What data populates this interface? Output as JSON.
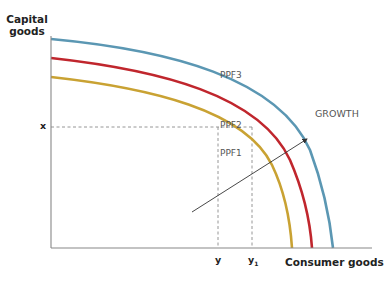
{
  "diagram": {
    "y_axis_label_line1": "Capital",
    "y_axis_label_line2": "goods",
    "x_axis_label": "Consumer goods",
    "x_tick": "x",
    "y_tick": "y",
    "y1_tick_main": "y",
    "y1_tick_sub": "1",
    "arrow_label": "GROWTH",
    "curves": [
      {
        "name": "PPF1",
        "color": "#c9a233"
      },
      {
        "name": "PPF2",
        "color": "#c0262d"
      },
      {
        "name": "PPF3",
        "color": "#5b97b3"
      }
    ],
    "axis_color": "#888888",
    "dash_color": "#8a8a8a"
  }
}
